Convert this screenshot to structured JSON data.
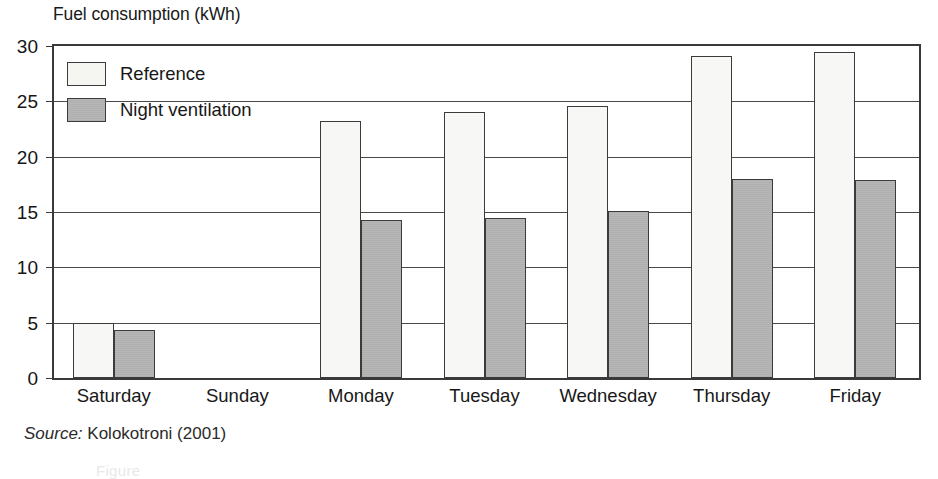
{
  "chart_data": {
    "type": "bar",
    "title": "Fuel consumption (kWh)",
    "xlabel": "",
    "ylabel": "Fuel consumption (kWh)",
    "ylim": [
      0,
      30
    ],
    "ytick_step": 5,
    "ytick_labels": [
      "30",
      "25",
      "20",
      "15",
      "10",
      "5",
      "0"
    ],
    "ytick_values": [
      30,
      25,
      20,
      15,
      10,
      5,
      0
    ],
    "grid": true,
    "grid_axis": "y",
    "legend_position": "top-left-inside",
    "categories": [
      "Saturday",
      "Sunday",
      "Monday",
      "Tuesday",
      "Wednesday",
      "Thursday",
      "Friday"
    ],
    "series": [
      {
        "name": "Reference",
        "color": "#f7f7f5",
        "values": [
          5.0,
          0,
          23.2,
          24.0,
          24.6,
          29.1,
          29.5
        ]
      },
      {
        "name": "Night ventilation",
        "color": "#b5b5b5",
        "values": [
          4.3,
          0,
          14.3,
          14.5,
          15.1,
          18.0,
          17.9
        ]
      }
    ],
    "source_prefix": "Source:",
    "source_text": "Kolokotroni (2001)"
  },
  "figure": {
    "axis_title": "Fuel consumption (kWh)",
    "bottom_caption_partial": "Figure"
  },
  "colors": {
    "reference_fill": "#f7f7f5",
    "night_fill": "#b5b5b5",
    "outline": "#3b3b3b",
    "gridline": "#4a4a4a",
    "text": "#171717"
  }
}
